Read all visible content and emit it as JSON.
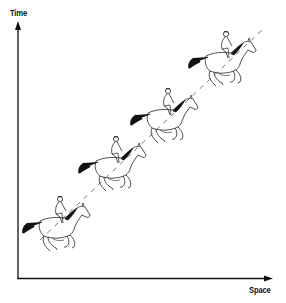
{
  "diagram": {
    "type": "space-time diagram",
    "axes": {
      "y_label": "Time",
      "x_label": "Space"
    },
    "figures": [
      {
        "name": "horse-and-rider-1",
        "description": "galloping horse with jockey",
        "position": "lower-left"
      },
      {
        "name": "horse-and-rider-2",
        "description": "galloping horse with jockey",
        "position": "lower-middle"
      },
      {
        "name": "horse-and-rider-3",
        "description": "galloping horse with jockey",
        "position": "upper-middle"
      },
      {
        "name": "horse-and-rider-4",
        "description": "galloping horse with jockey",
        "position": "upper-right"
      }
    ],
    "worldline": "dashed diagonal line through figures from lower-left to upper-right"
  },
  "colors": {
    "axis": "#111111",
    "line": "#222222",
    "mane_tail": "#111111",
    "background": "#ffffff"
  }
}
